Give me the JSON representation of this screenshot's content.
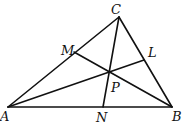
{
  "diagram": {
    "type": "triangle with three cevians concurrent at P",
    "points": {
      "A": {
        "x": 8,
        "y": 107
      },
      "B": {
        "x": 172,
        "y": 107
      },
      "C": {
        "x": 119,
        "y": 17
      },
      "M": {
        "x": 74,
        "y": 52
      },
      "L": {
        "x": 144,
        "y": 60
      },
      "N": {
        "x": 103,
        "y": 107
      },
      "P": {
        "x": 109,
        "y": 70
      }
    },
    "segments": [
      [
        "A",
        "B"
      ],
      [
        "B",
        "C"
      ],
      [
        "C",
        "A"
      ],
      [
        "A",
        "L"
      ],
      [
        "B",
        "M"
      ],
      [
        "C",
        "N"
      ]
    ],
    "labels": [
      {
        "text": "A",
        "x": 0,
        "y": 121
      },
      {
        "text": "B",
        "x": 172,
        "y": 121
      },
      {
        "text": "C",
        "x": 111,
        "y": 14
      },
      {
        "text": "M",
        "x": 61,
        "y": 55
      },
      {
        "text": "L",
        "x": 148,
        "y": 57
      },
      {
        "text": "N",
        "x": 96,
        "y": 122
      },
      {
        "text": "P",
        "x": 111,
        "y": 92
      }
    ]
  }
}
